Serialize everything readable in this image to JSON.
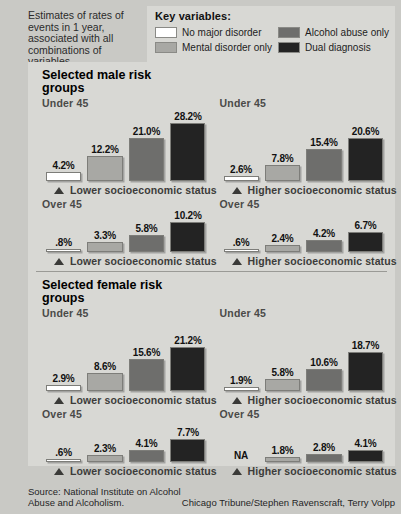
{
  "intro": {
    "text": "Estimates of rates of events in 1 year, associated with all combinations of variables"
  },
  "legend": {
    "title": "Key variables:",
    "items": [
      {
        "label": "No major disorder",
        "color": "#ffffff"
      },
      {
        "label": "Alcohol abuse only",
        "color": "#6e6e6c"
      },
      {
        "label": "Mental disorder only",
        "color": "#a8a8a4"
      },
      {
        "label": "Dual diagnosis",
        "color": "#232323"
      }
    ]
  },
  "sections": [
    {
      "title": "Selected male risk groups",
      "rows": [
        {
          "age": "Under 45",
          "scale_max": 30.0,
          "halves": [
            {
              "axis": "Lower socioeconomic status",
              "values": [
                "4.2%",
                "12.2%",
                "21.0%",
                "28.2%"
              ],
              "numbers": [
                4.2,
                12.2,
                21.0,
                28.2
              ]
            },
            {
              "axis": "Higher socioeconomic status",
              "values": [
                "2.6%",
                "7.8%",
                "15.4%",
                "20.6%"
              ],
              "numbers": [
                2.6,
                7.8,
                15.4,
                20.6
              ]
            }
          ]
        },
        {
          "age": "Over 45",
          "scale_max": 11.5,
          "halves": [
            {
              "axis": "Lower socioeconomic status",
              "values": [
                ".8%",
                "3.3%",
                "5.8%",
                "10.2%"
              ],
              "numbers": [
                0.8,
                3.3,
                5.8,
                10.2
              ]
            },
            {
              "axis": "Higher socioeconomic status",
              "values": [
                ".6%",
                "2.4%",
                "4.2%",
                "6.7%"
              ],
              "numbers": [
                0.6,
                2.4,
                4.2,
                6.7
              ]
            }
          ]
        }
      ]
    },
    {
      "title": "Selected female risk groups",
      "rows": [
        {
          "age": "Under 45",
          "scale_max": 30.0,
          "halves": [
            {
              "axis": "Lower socioeconomic status",
              "values": [
                "2.9%",
                "8.6%",
                "15.6%",
                "21.2%"
              ],
              "numbers": [
                2.9,
                8.6,
                15.6,
                21.2
              ]
            },
            {
              "axis": "Higher socioeconomic status",
              "values": [
                "1.9%",
                "5.8%",
                "10.6%",
                "18.7%"
              ],
              "numbers": [
                1.9,
                5.8,
                10.6,
                18.7
              ]
            }
          ]
        },
        {
          "age": "Over 45",
          "scale_max": 11.5,
          "halves": [
            {
              "axis": "Lower socioeconomic status",
              "values": [
                ".6%",
                "2.3%",
                "4.1%",
                "7.7%"
              ],
              "numbers": [
                0.6,
                2.3,
                4.1,
                7.7
              ]
            },
            {
              "axis": "Higher socioeconomic status",
              "values": [
                "NA",
                "1.8%",
                "2.8%",
                "4.1%"
              ],
              "numbers": [
                null,
                1.8,
                2.8,
                4.1
              ]
            }
          ]
        }
      ]
    }
  ],
  "footer": {
    "source": "Source: National Institute on Alcohol Abuse and Alcoholism.",
    "credit": "Chicago Tribune/Stephen Ravenscraft, Terry Volpp"
  },
  "chart_data": {
    "type": "bar",
    "title": "Estimates of rates of events in 1 year, associated with all combinations of variables",
    "xlabel": "",
    "ylabel": "Rate (%)",
    "grid": false,
    "legend_position": "top",
    "categories": [
      "No major disorder",
      "Mental disorder only",
      "Alcohol abuse only",
      "Dual diagnosis"
    ],
    "series": [
      {
        "name": "Male, Under 45, Lower socioeconomic status",
        "values": [
          4.2,
          12.2,
          21.0,
          28.2
        ]
      },
      {
        "name": "Male, Under 45, Higher socioeconomic status",
        "values": [
          2.6,
          7.8,
          15.4,
          20.6
        ]
      },
      {
        "name": "Male, Over 45, Lower socioeconomic status",
        "values": [
          0.8,
          3.3,
          5.8,
          10.2
        ]
      },
      {
        "name": "Male, Over 45, Higher socioeconomic status",
        "values": [
          0.6,
          2.4,
          4.2,
          6.7
        ]
      },
      {
        "name": "Female, Under 45, Lower socioeconomic status",
        "values": [
          2.9,
          8.6,
          15.6,
          21.2
        ]
      },
      {
        "name": "Female, Under 45, Higher socioeconomic status",
        "values": [
          1.9,
          5.8,
          10.6,
          18.7
        ]
      },
      {
        "name": "Female, Over 45, Lower socioeconomic status",
        "values": [
          0.6,
          2.3,
          4.1,
          7.7
        ]
      },
      {
        "name": "Female, Over 45, Higher socioeconomic status",
        "values": [
          null,
          1.8,
          2.8,
          4.1
        ]
      }
    ]
  }
}
